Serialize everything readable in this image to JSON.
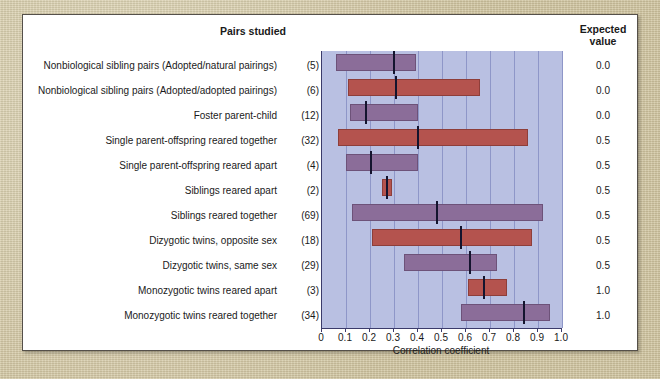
{
  "figure": {
    "pairs_header": "Pairs studied",
    "expected_header_line1": "Expected",
    "expected_header_line2": "value",
    "xaxis_title": "Correlation coefficient"
  },
  "chart_data": {
    "type": "bar",
    "title": "Pairs studied",
    "xlabel": "Correlation coefficient",
    "ylabel": "",
    "xlim": [
      0,
      1.0
    ],
    "grid": true,
    "legend": "none",
    "orientation": "horizontal",
    "plot_background": "#b9c0e2",
    "colors": {
      "purple": "#8b6d99",
      "red": "#b4534e",
      "marker": "#14142e"
    },
    "xticks": [
      "0",
      "0.1",
      "0.2",
      "0.3",
      "0.4",
      "0.5",
      "0.6",
      "0.7",
      "0.8",
      "0.9",
      "1.0"
    ],
    "xtick_values": [
      0,
      0.1,
      0.2,
      0.3,
      0.4,
      0.5,
      0.6,
      0.7,
      0.8,
      0.9,
      1.0
    ],
    "categories": [
      "Nonbiological sibling pairs (Adopted/natural pairings)",
      "Nonbiological sibling pairs (Adopted/adopted pairings)",
      "Foster parent-child",
      "Single parent-offspring reared together",
      "Single parent-offspring reared apart",
      "Siblings reared apart",
      "Siblings reared together",
      "Dizygotic twins, opposite sex",
      "Dizygotic twins, same sex",
      "Monozygotic twins reared apart",
      "Monozygotic twins reared together"
    ],
    "rows": [
      {
        "label": "Nonbiological sibling pairs (Adopted/natural pairings)",
        "n": "(5)",
        "range_start": 0.06,
        "range_end": 0.39,
        "median": 0.3,
        "color": "purple",
        "expected": "0.0"
      },
      {
        "label": "Nonbiological sibling pairs (Adopted/adopted pairings)",
        "n": "(6)",
        "range_start": 0.11,
        "range_end": 0.66,
        "median": 0.31,
        "color": "red",
        "expected": "0.0"
      },
      {
        "label": "Foster parent-child",
        "n": "(12)",
        "range_start": 0.115,
        "range_end": 0.4,
        "median": 0.185,
        "color": "purple",
        "expected": "0.0"
      },
      {
        "label": "Single parent-offspring reared together",
        "n": "(32)",
        "range_start": 0.065,
        "range_end": 0.86,
        "median": 0.4,
        "color": "red",
        "expected": "0.5"
      },
      {
        "label": "Single parent-offspring reared apart",
        "n": "(4)",
        "range_start": 0.1,
        "range_end": 0.4,
        "median": 0.205,
        "color": "purple",
        "expected": "0.5"
      },
      {
        "label": "Siblings reared apart",
        "n": "(2)",
        "range_start": 0.25,
        "range_end": 0.29,
        "median": 0.27,
        "color": "red",
        "expected": "0.5"
      },
      {
        "label": "Siblings reared together",
        "n": "(69)",
        "range_start": 0.125,
        "range_end": 0.92,
        "median": 0.48,
        "color": "purple",
        "expected": "0.5"
      },
      {
        "label": "Dizygotic twins, opposite sex",
        "n": "(18)",
        "range_start": 0.21,
        "range_end": 0.875,
        "median": 0.58,
        "color": "red",
        "expected": "0.5"
      },
      {
        "label": "Dizygotic twins, same sex",
        "n": "(29)",
        "range_start": 0.34,
        "range_end": 0.73,
        "median": 0.615,
        "color": "purple",
        "expected": "0.5"
      },
      {
        "label": "Monozygotic twins reared apart",
        "n": "(3)",
        "range_start": 0.61,
        "range_end": 0.77,
        "median": 0.675,
        "color": "red",
        "expected": "1.0"
      },
      {
        "label": "Monozygotic twins reared together",
        "n": "(34)",
        "range_start": 0.58,
        "range_end": 0.95,
        "median": 0.84,
        "color": "purple",
        "expected": "1.0"
      }
    ]
  }
}
